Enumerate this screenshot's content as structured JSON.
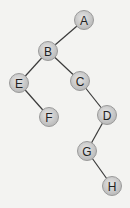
{
  "diagram": {
    "type": "binary-tree",
    "colors": {
      "background": "#f3f3f1",
      "node_fill_center": "#e6e6e6",
      "node_fill_edge": "#b9b9b9",
      "edge": "#3a3a3a",
      "label": "#222222"
    },
    "nodes": [
      {
        "id": "A",
        "label": "A",
        "x": 84,
        "y": 20
      },
      {
        "id": "B",
        "label": "B",
        "x": 48,
        "y": 51
      },
      {
        "id": "E",
        "label": "E",
        "x": 19,
        "y": 83
      },
      {
        "id": "C",
        "label": "C",
        "x": 80,
        "y": 81
      },
      {
        "id": "F",
        "label": "F",
        "x": 49,
        "y": 117
      },
      {
        "id": "D",
        "label": "D",
        "x": 107,
        "y": 115
      },
      {
        "id": "G",
        "label": "G",
        "x": 87,
        "y": 151
      },
      {
        "id": "H",
        "label": "H",
        "x": 112,
        "y": 186
      }
    ],
    "edges": [
      {
        "from": "A",
        "to": "B"
      },
      {
        "from": "B",
        "to": "E"
      },
      {
        "from": "B",
        "to": "C"
      },
      {
        "from": "E",
        "to": "F"
      },
      {
        "from": "C",
        "to": "D"
      },
      {
        "from": "D",
        "to": "G"
      },
      {
        "from": "G",
        "to": "H"
      }
    ]
  }
}
